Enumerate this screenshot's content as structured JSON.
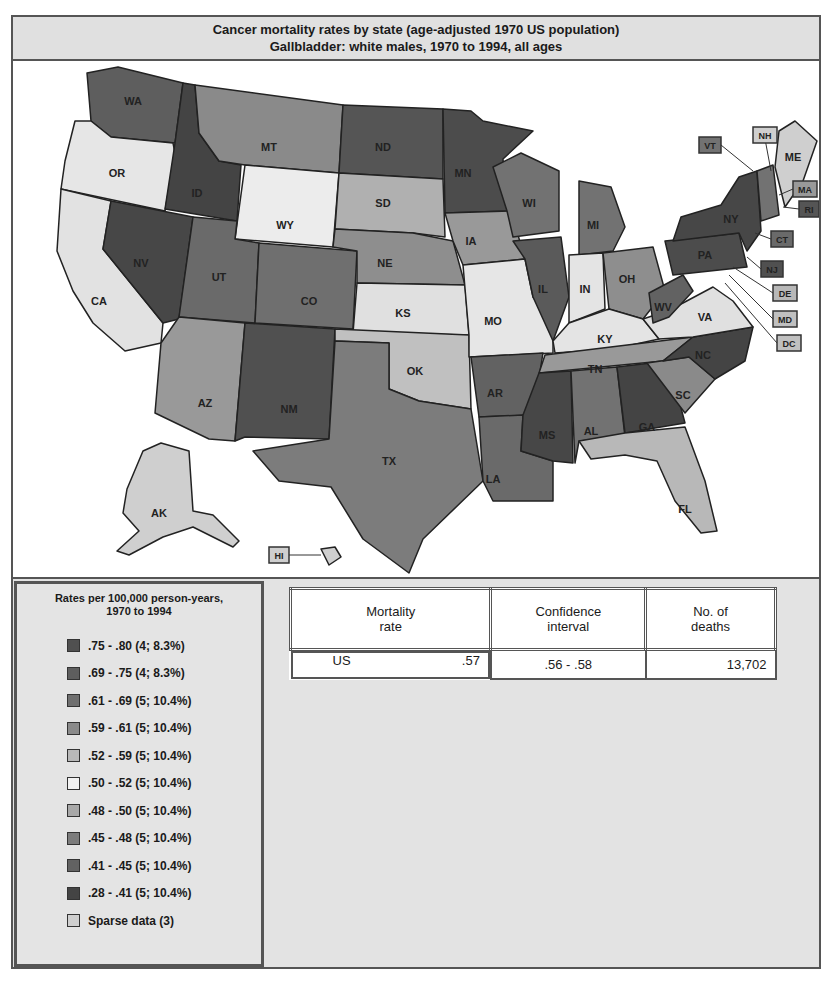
{
  "title": {
    "line1": "Cancer mortality rates by state (age-adjusted 1970 US population)",
    "line2": "Gallbladder:  white males, 1970 to 1994, all ages"
  },
  "legend": {
    "title_line1": "Rates per 100,000 person-years,",
    "title_line2": "1970 to 1994",
    "items": [
      {
        "label": ".75 - .80 (4; 8.3%)",
        "color": "#505050"
      },
      {
        "label": ".69 - .75 (4; 8.3%)",
        "color": "#5e5e5e"
      },
      {
        "label": ".61 - .69 (5; 10.4%)",
        "color": "#6f6f6f"
      },
      {
        "label": ".59 - .61 (5; 10.4%)",
        "color": "#8a8a8a"
      },
      {
        "label": ".52 - .59 (5; 10.4%)",
        "color": "#b8b8b8"
      },
      {
        "label": ".50 - .52 (5; 10.4%)",
        "color": "#f2f2f2"
      },
      {
        "label": ".48 - .50 (5; 10.4%)",
        "color": "#a8a8a8"
      },
      {
        "label": ".45 - .48 (5; 10.4%)",
        "color": "#7c7c7c"
      },
      {
        "label": ".41 - .45 (5; 10.4%)",
        "color": "#626262"
      },
      {
        "label": ".28 - .41 (5; 10.4%)",
        "color": "#444444"
      },
      {
        "label": "Sparse data (3)",
        "color": "#cfcfcf"
      }
    ]
  },
  "stats": {
    "headers": [
      "Mortality\nrate",
      "Confidence\ninterval",
      "No. of\ndeaths"
    ],
    "header_lines": [
      [
        "Mortality",
        "rate"
      ],
      [
        "Confidence",
        "interval"
      ],
      [
        "No. of",
        "deaths"
      ]
    ],
    "row": {
      "region": "US",
      "rate": ".57",
      "ci": ".56 - .58",
      "deaths": "13,702"
    }
  },
  "states": [
    {
      "abbr": "WA",
      "color": "#5e5e5e"
    },
    {
      "abbr": "OR",
      "color": "#e6e6e6"
    },
    {
      "abbr": "CA",
      "color": "#e2e2e2"
    },
    {
      "abbr": "ID",
      "color": "#444444"
    },
    {
      "abbr": "NV",
      "color": "#474747"
    },
    {
      "abbr": "MT",
      "color": "#8a8a8a"
    },
    {
      "abbr": "WY",
      "color": "#ececec"
    },
    {
      "abbr": "UT",
      "color": "#6a6a6a"
    },
    {
      "abbr": "CO",
      "color": "#6f6f6f"
    },
    {
      "abbr": "AZ",
      "color": "#999999"
    },
    {
      "abbr": "NM",
      "color": "#505050"
    },
    {
      "abbr": "ND",
      "color": "#555555"
    },
    {
      "abbr": "SD",
      "color": "#b0b0b0"
    },
    {
      "abbr": "NE",
      "color": "#8e8e8e"
    },
    {
      "abbr": "KS",
      "color": "#e0e0e0"
    },
    {
      "abbr": "OK",
      "color": "#c0c0c0"
    },
    {
      "abbr": "TX",
      "color": "#7c7c7c"
    },
    {
      "abbr": "MN",
      "color": "#4c4c4c"
    },
    {
      "abbr": "IA",
      "color": "#999999"
    },
    {
      "abbr": "MO",
      "color": "#e6e6e6"
    },
    {
      "abbr": "AR",
      "color": "#626262"
    },
    {
      "abbr": "LA",
      "color": "#6a6a6a"
    },
    {
      "abbr": "WI",
      "color": "#727272"
    },
    {
      "abbr": "IL",
      "color": "#5a5a5a"
    },
    {
      "abbr": "MI",
      "color": "#727272"
    },
    {
      "abbr": "IN",
      "color": "#e4e4e4"
    },
    {
      "abbr": "OH",
      "color": "#8e8e8e"
    },
    {
      "abbr": "KY",
      "color": "#e4e4e4"
    },
    {
      "abbr": "TN",
      "color": "#999999"
    },
    {
      "abbr": "MS",
      "color": "#474747"
    },
    {
      "abbr": "AL",
      "color": "#727272"
    },
    {
      "abbr": "GA",
      "color": "#444444"
    },
    {
      "abbr": "FL",
      "color": "#b8b8b8"
    },
    {
      "abbr": "SC",
      "color": "#8a8a8a"
    },
    {
      "abbr": "NC",
      "color": "#444444"
    },
    {
      "abbr": "VA",
      "color": "#e0e0e0"
    },
    {
      "abbr": "WV",
      "color": "#626262"
    },
    {
      "abbr": "PA",
      "color": "#4c4c4c"
    },
    {
      "abbr": "NY",
      "color": "#474747"
    },
    {
      "abbr": "ME",
      "color": "#cfcfcf"
    },
    {
      "abbr": "AK",
      "color": "#cfcfcf"
    },
    {
      "abbr": "HI",
      "color": "#cfcfcf"
    }
  ],
  "callouts": [
    {
      "abbr": "VT",
      "color": "#727272"
    },
    {
      "abbr": "NH",
      "color": "#cfcfcf"
    },
    {
      "abbr": "MA",
      "color": "#999999"
    },
    {
      "abbr": "RI",
      "color": "#555555"
    },
    {
      "abbr": "CT",
      "color": "#6a6a6a"
    },
    {
      "abbr": "NJ",
      "color": "#505050"
    },
    {
      "abbr": "DE",
      "color": "#b8b8b8"
    },
    {
      "abbr": "MD",
      "color": "#c0c0c0"
    },
    {
      "abbr": "DC",
      "color": "#c0c0c0"
    },
    {
      "abbr": "HI",
      "color": "#cfcfcf"
    }
  ]
}
